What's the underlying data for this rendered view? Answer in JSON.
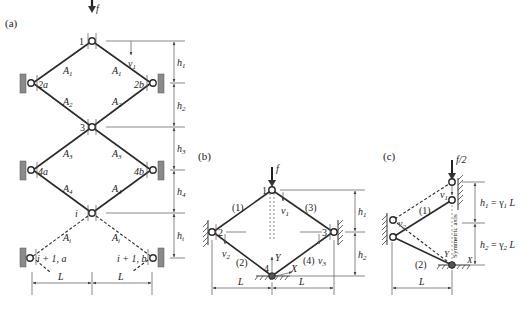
{
  "figure": {
    "panel_a": {
      "label": "(a)",
      "load": "f",
      "nodes": {
        "n1": "1",
        "n2a": "2a",
        "n2b": "2b",
        "n3": "3",
        "n4a": "4a",
        "n4b": "4b",
        "ni": "i",
        "ni1a": "i + 1, a",
        "ni1b": "i + 1, b"
      },
      "members": {
        "A1_left": "A",
        "A1_left_sub": "1",
        "A1_right": "A",
        "A1_right_sub": "1",
        "A2_left": "A",
        "A2_left_sub": "2",
        "A2_right": "A",
        "A2_right_sub": "2",
        "A3_left": "A",
        "A3_left_sub": "3",
        "A3_right": "A",
        "A3_right_sub": "3",
        "A4_left": "A",
        "A4_left_sub": "4",
        "A4_right": "A",
        "A4_right_sub": "4",
        "Ai_left": "A",
        "Ai_left_sub": "i",
        "Ai_right": "A",
        "Ai_right_sub": "i"
      },
      "displacement": {
        "v": "v",
        "sub": "1"
      },
      "heights": [
        {
          "h": "h",
          "sub": "1"
        },
        {
          "h": "h",
          "sub": "2"
        },
        {
          "h": "h",
          "sub": "3"
        },
        {
          "h": "h",
          "sub": "4"
        },
        {
          "h": "h",
          "sub": "i"
        }
      ],
      "spans": [
        "L",
        "L"
      ]
    },
    "panel_b": {
      "label": "(b)",
      "load": "f",
      "nodes": {
        "n1": "1",
        "n2": "2",
        "n3": "3",
        "n4": "4"
      },
      "members": [
        "(1)",
        "(2)",
        "(3)",
        "(4)"
      ],
      "displacements": [
        {
          "v": "v",
          "sub": "1"
        },
        {
          "v": "v",
          "sub": "2"
        },
        {
          "v": "v",
          "sub": "3"
        }
      ],
      "axes": {
        "x": "X",
        "y": "Y"
      },
      "heights": [
        {
          "h": "h",
          "sub": "1"
        },
        {
          "h": "h",
          "sub": "2"
        }
      ],
      "spans": [
        "L",
        "L"
      ]
    },
    "panel_c": {
      "label": "(c)",
      "load": "f/2",
      "members": [
        "(1)",
        "(2)"
      ],
      "displacements": [
        {
          "v": "v",
          "sub": "1"
        },
        {
          "v": "v",
          "sub": "2"
        }
      ],
      "axes": {
        "x": "X",
        "y": "Y"
      },
      "symmetric_axis": "Symmetric axis",
      "heights": [
        {
          "h": "h",
          "sub": "1",
          "eq": " = γ",
          "gsub": "1",
          "tail": " L"
        },
        {
          "h": "h",
          "sub": "2",
          "eq": " = γ",
          "gsub": "2",
          "tail": " L"
        }
      ],
      "span": "L"
    }
  }
}
